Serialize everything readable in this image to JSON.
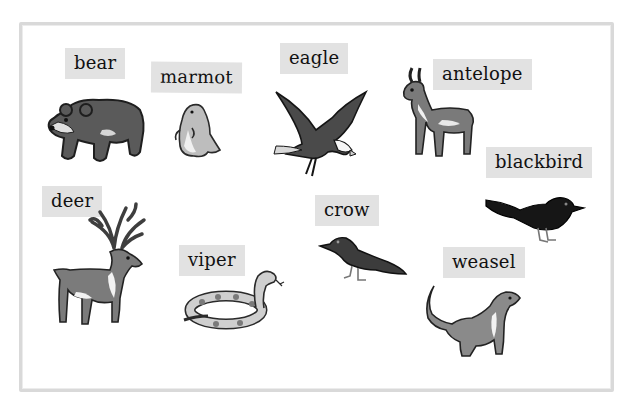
{
  "worksheet": {
    "labels": [
      {
        "id": "bear",
        "text": "bear"
      },
      {
        "id": "marmot",
        "text": "marmot"
      },
      {
        "id": "eagle",
        "text": "eagle"
      },
      {
        "id": "antelope",
        "text": "antelope"
      },
      {
        "id": "blackbird",
        "text": "blackbird"
      },
      {
        "id": "deer",
        "text": "deer"
      },
      {
        "id": "crow",
        "text": "crow"
      },
      {
        "id": "viper",
        "text": "viper"
      },
      {
        "id": "weasel",
        "text": "weasel"
      }
    ],
    "colors": {
      "label_bg": "#e2e2e2",
      "border": "#d9d9d9",
      "animal_dark": "#3a3a3a",
      "animal_mid": "#6e6e6e",
      "animal_light": "#a8a8a8"
    }
  }
}
